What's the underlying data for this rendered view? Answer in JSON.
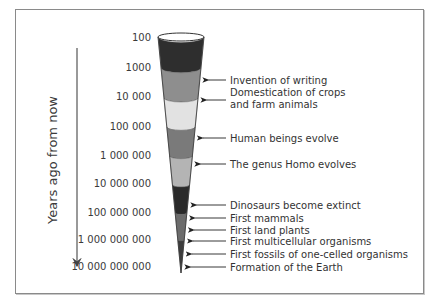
{
  "axis": {
    "label": "Years ago from now",
    "ticks": [
      {
        "label": "100",
        "y": 41
      },
      {
        "label": "1000",
        "y": 71
      },
      {
        "label": "10 000",
        "y": 100
      },
      {
        "label": "100 000",
        "y": 130
      },
      {
        "label": "1 000 000",
        "y": 159
      },
      {
        "label": "10 000 000",
        "y": 187
      },
      {
        "label": "100 000 000",
        "y": 216
      },
      {
        "label": "1 000 000 000",
        "y": 243
      },
      {
        "label": "10 000 000 000",
        "y": 270
      }
    ]
  },
  "events": [
    {
      "lines": [
        "Invention of writing"
      ],
      "arrow_y": 80
    },
    {
      "lines": [
        "Domestication of crops",
        "and farm animals"
      ],
      "arrow_y": 100
    },
    {
      "lines": [
        "Human beings evolve"
      ],
      "arrow_y": 138
    },
    {
      "lines": [
        "The genus Homo evolves"
      ],
      "arrow_y": 164
    },
    {
      "lines": [
        "Dinosaurs become extinct"
      ],
      "arrow_y": 205
    },
    {
      "lines": [
        "First mammals"
      ],
      "arrow_y": 218
    },
    {
      "lines": [
        "First land plants"
      ],
      "arrow_y": 230
    },
    {
      "lines": [
        "First multicellular organisms"
      ],
      "arrow_y": 241
    },
    {
      "lines": [
        "First fossils of one-celled organisms"
      ],
      "arrow_y": 254
    },
    {
      "lines": [
        "Formation of the Earth"
      ],
      "arrow_y": 267
    }
  ],
  "cone": {
    "top_y": 35,
    "tip_y": 273,
    "center_x": 181,
    "top_half_width": 23,
    "bands": [
      {
        "from_y": 37,
        "to_y": 68,
        "color": "#2e2e2e"
      },
      {
        "from_y": 68,
        "to_y": 98,
        "color": "#8e8e8e"
      },
      {
        "from_y": 98,
        "to_y": 127,
        "color": "#e2e2e2"
      },
      {
        "from_y": 127,
        "to_y": 156,
        "color": "#7a7a7a"
      },
      {
        "from_y": 156,
        "to_y": 185,
        "color": "#b4b4b4"
      },
      {
        "from_y": 185,
        "to_y": 213,
        "color": "#2a2a2a"
      },
      {
        "from_y": 213,
        "to_y": 240,
        "color": "#6c6c6c"
      },
      {
        "from_y": 240,
        "to_y": 273,
        "color": "#3c3c3c"
      }
    ]
  }
}
